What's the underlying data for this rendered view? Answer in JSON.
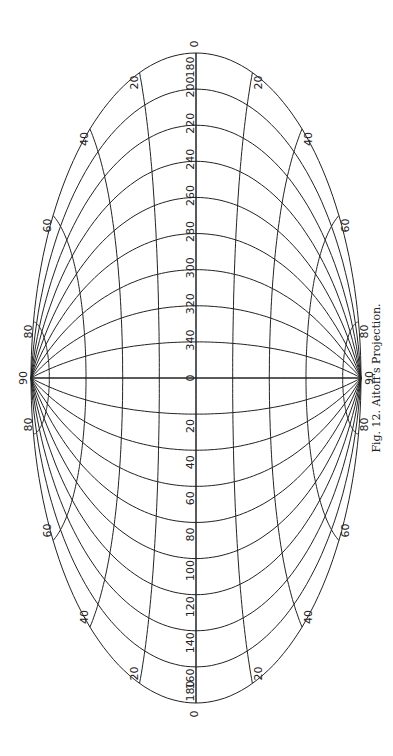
{
  "caption": "Fig. 12.  Aitoff's Projection.",
  "projection": "Aitoff",
  "center_label": "0",
  "pole_labels": {
    "left": "90",
    "right": "90"
  },
  "axis_end_labels": {
    "top_outer": "0",
    "top_inner": "180",
    "bottom_inner": "180",
    "bottom_outer": "0"
  },
  "meridian_labels_top": [
    "200",
    "220",
    "240",
    "260",
    "280",
    "300",
    "320",
    "340"
  ],
  "meridian_labels_bottom": [
    "20",
    "40",
    "60",
    "80",
    "100",
    "120",
    "140",
    "160"
  ],
  "parallel_labels": [
    "20",
    "40",
    "60",
    "80"
  ],
  "colors": {
    "line": "#222222",
    "background": "#ffffff"
  }
}
